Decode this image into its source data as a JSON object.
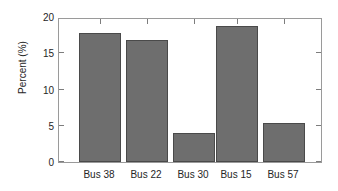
{
  "chart_data": {
    "type": "bar",
    "title": "",
    "xlabel": "",
    "ylabel": "Percent (%)",
    "categories": [
      "Bus 38",
      "Bus 22",
      "Bus 30",
      "Bus 15",
      "Bus 57"
    ],
    "values": [
      18.0,
      17.1,
      4.0,
      19.0,
      5.5
    ],
    "ylim": [
      0,
      20
    ],
    "yticks": [
      0,
      5,
      10,
      15,
      20
    ],
    "ytick_labels": [
      "0",
      "5",
      "10",
      "15",
      "20"
    ],
    "grid": false,
    "legend": false,
    "bar_color": "#6e6e6e",
    "bar_edge_color": "#4a4a4a",
    "axis_color": "#9a9a9a",
    "background_color": "#ffffff"
  },
  "axes": {
    "y_axis_label": "Percent (%)",
    "y_tick_0": "0",
    "y_tick_1": "5",
    "y_tick_2": "10",
    "y_tick_3": "15",
    "y_tick_4": "20",
    "x_tick_0": "Bus 38",
    "x_tick_1": "Bus 22",
    "x_tick_2": "Bus 30",
    "x_tick_3": "Bus 15",
    "x_tick_4": "Bus 57"
  }
}
